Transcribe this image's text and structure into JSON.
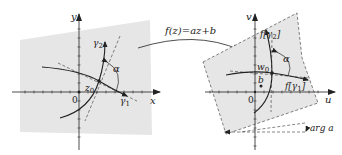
{
  "left_plane": {
    "x_axis_label": "x",
    "y_axis_label": "y",
    "origin_label": "0",
    "point_label": "z",
    "point_sub": "0",
    "curve1_label": "γ",
    "curve1_sub": "1",
    "curve2_label": "γ",
    "curve2_sub": "2",
    "angle_label": "α"
  },
  "mapping": {
    "label": "f(z)=az+b"
  },
  "right_plane": {
    "u_axis_label": "u",
    "v_axis_label": "v",
    "origin_label": "0",
    "point_label": "w",
    "point_sub": "0",
    "b_label": "b",
    "curve1_label": "f[γ",
    "curve1_sub": "1",
    "curve1_close": "]",
    "curve2_label": "f[γ",
    "curve2_sub": "2",
    "curve2_close": "]",
    "angle_label": "α",
    "rotation_label": "arg a"
  },
  "colors": {
    "region_fill": "#e6e6e6",
    "ink": "#222222"
  }
}
